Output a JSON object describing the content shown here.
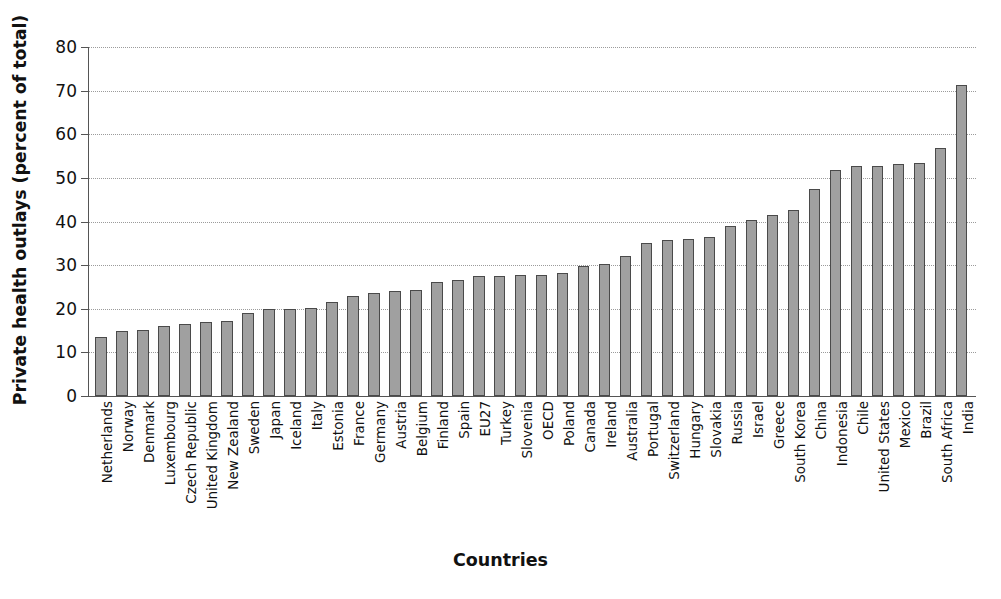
{
  "chart_data": {
    "type": "bar",
    "title": "",
    "xlabel": "Countries",
    "ylabel": "Private health outlays (percent of total)",
    "ylim": [
      0,
      80
    ],
    "ytick_values": [
      0,
      10,
      20,
      30,
      40,
      50,
      60,
      70,
      80
    ],
    "ytick_labels": [
      "0",
      "10",
      "20",
      "30",
      "40",
      "50",
      "60",
      "70",
      "80"
    ],
    "grid": true,
    "legend": false,
    "bar_color": "#a0a0a0",
    "bar_edge_color": "#4a4a4a",
    "categories": [
      "Netherlands",
      "Norway",
      "Denmark",
      "Luxembourg",
      "Czech Republic",
      "United Kingdom",
      "New Zealand",
      "Sweden",
      "Japan",
      "Iceland",
      "Italy",
      "Estonia",
      "France",
      "Germany",
      "Austria",
      "Belgium",
      "Finland",
      "Spain",
      "EU27",
      "Turkey",
      "Slovenia",
      "OECD",
      "Poland",
      "Canada",
      "Ireland",
      "Australia",
      "Portugal",
      "Switzerland",
      "Hungary",
      "Slovakia",
      "Russia",
      "Israel",
      "Greece",
      "South Korea",
      "China",
      "Indonesia",
      "Chile",
      "United States",
      "Mexico",
      "Brazil",
      "South Africa",
      "India"
    ],
    "values": [
      13.6,
      15.0,
      15.2,
      16.1,
      16.6,
      17.0,
      17.1,
      19.1,
      19.9,
      20.0,
      20.1,
      21.6,
      23.0,
      23.6,
      24.1,
      24.3,
      26.1,
      26.6,
      27.4,
      27.6,
      27.7,
      27.8,
      28.2,
      29.7,
      30.2,
      32.1,
      35.1,
      35.7,
      36.0,
      36.4,
      38.9,
      40.4,
      41.5,
      42.6,
      47.4,
      51.8,
      52.7,
      52.8,
      53.1,
      53.4,
      56.9,
      71.4
    ]
  }
}
